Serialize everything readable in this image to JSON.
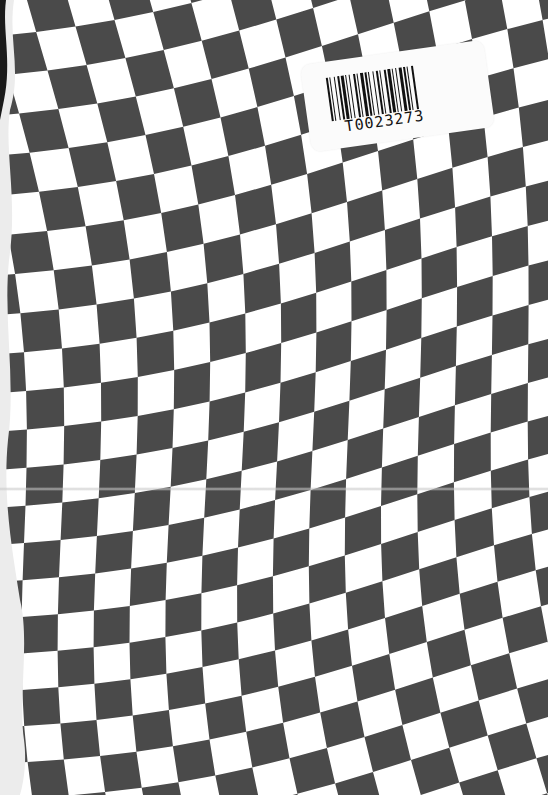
{
  "cover": {
    "type": "scanned book cover",
    "pattern": "warped checkerboard",
    "colors": {
      "dark": "#4a4a4a",
      "light": "#ffffff",
      "edge": "#e8e8e8"
    }
  },
  "barcode_label": {
    "text": "T0023273"
  }
}
